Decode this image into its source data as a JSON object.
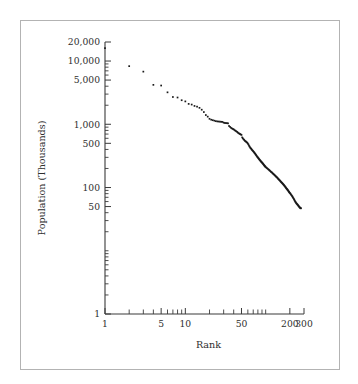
{
  "figure": {
    "border_color": "#b3b3b3",
    "background": "#ffffff"
  },
  "chart_data": {
    "type": "scatter",
    "title": "",
    "subtitle": "",
    "xlabel": "Rank",
    "ylabel": "Population (Thousands)",
    "xscale": "log",
    "yscale": "log",
    "xlim": [
      1,
      300
    ],
    "ylim": [
      1,
      20000
    ],
    "grid": false,
    "legend": null,
    "marker": "dot",
    "marker_color": "#1a1a1a",
    "x_tick_labels": [
      "1",
      "5",
      "10",
      "50",
      "200",
      "300"
    ],
    "x_tick_values": [
      1,
      5,
      10,
      50,
      200,
      300
    ],
    "x_minor_ticks": [
      2,
      3,
      4,
      6,
      7,
      8,
      9,
      20,
      30,
      40,
      60,
      70,
      80,
      90,
      100
    ],
    "y_tick_labels": [
      "1",
      "50",
      "100",
      "500",
      "1,000",
      "5,000",
      "10,000",
      "20,000"
    ],
    "y_tick_values": [
      1,
      50,
      100,
      500,
      1000,
      5000,
      10000,
      20000
    ],
    "y_minor_ticks": [
      2,
      3,
      4,
      5,
      6,
      7,
      8,
      9,
      10,
      20,
      30,
      40,
      60,
      70,
      80,
      90,
      200,
      300,
      400,
      600,
      700,
      800,
      900,
      2000,
      3000,
      4000,
      6000,
      7000,
      8000,
      9000
    ],
    "series": [
      {
        "name": "Population by rank",
        "x": [
          1,
          2,
          3,
          4,
          5,
          6,
          7,
          8,
          9,
          10,
          11,
          12,
          13,
          14,
          15,
          16,
          17,
          18,
          19,
          20,
          21,
          22,
          23,
          24,
          25,
          26,
          27,
          28,
          29,
          30,
          31,
          32,
          33,
          34,
          35,
          36,
          37,
          38,
          39,
          40,
          41,
          42,
          43,
          44,
          45,
          46,
          47,
          48,
          49,
          50,
          51,
          52,
          53,
          54,
          55,
          56,
          57,
          58,
          59,
          60,
          61,
          62,
          63,
          64,
          65,
          66,
          67,
          68,
          69,
          70,
          71,
          72,
          73,
          74,
          75,
          76,
          77,
          78,
          79,
          80,
          81,
          82,
          83,
          84,
          85,
          86,
          87,
          88,
          89,
          90,
          91,
          92,
          93,
          94,
          95,
          96,
          97,
          98,
          99,
          100,
          102,
          104,
          106,
          108,
          110,
          112,
          114,
          116,
          118,
          120,
          122,
          124,
          126,
          128,
          130,
          132,
          134,
          136,
          138,
          140,
          142,
          144,
          146,
          148,
          150,
          152,
          154,
          156,
          158,
          160,
          162,
          164,
          166,
          168,
          170,
          172,
          174,
          176,
          178,
          180,
          182,
          184,
          186,
          188,
          190,
          192,
          194,
          196,
          198,
          200,
          203,
          206,
          209,
          212,
          215,
          218,
          221,
          224,
          227,
          230,
          233,
          236,
          239,
          242,
          245,
          248,
          251,
          254,
          257,
          260,
          263,
          266,
          269,
          272,
          275
        ],
        "y": [
          16000,
          8300,
          6800,
          4200,
          4100,
          3200,
          2700,
          2650,
          2400,
          2300,
          2100,
          2050,
          1950,
          1900,
          1820,
          1700,
          1560,
          1400,
          1320,
          1220,
          1180,
          1160,
          1140,
          1120,
          1110,
          1105,
          1100,
          1095,
          1090,
          1060,
          1050,
          1045,
          1040,
          1035,
          940,
          910,
          880,
          860,
          845,
          830,
          810,
          790,
          775,
          760,
          740,
          725,
          710,
          700,
          690,
          680,
          620,
          600,
          580,
          565,
          550,
          540,
          530,
          520,
          510,
          495,
          480,
          460,
          445,
          430,
          420,
          410,
          400,
          390,
          382,
          375,
          366,
          358,
          350,
          342,
          334,
          326,
          318,
          310,
          304,
          298,
          292,
          286,
          280,
          275,
          270,
          265,
          260,
          256,
          252,
          248,
          244,
          240,
          236,
          232,
          228,
          224,
          220,
          217,
          214,
          211,
          206,
          202,
          198,
          194,
          190,
          186,
          182,
          178,
          175,
          172,
          168,
          165,
          162,
          159,
          156,
          153,
          150,
          147,
          145,
          142,
          139,
          136,
          134,
          131,
          129,
          127,
          124,
          122,
          120,
          118,
          116,
          114,
          112,
          110,
          108,
          106,
          104,
          102,
          100,
          98,
          96,
          95,
          93,
          91,
          90,
          88,
          86,
          85,
          83,
          82,
          80,
          78,
          76,
          74,
          72,
          70,
          68,
          66,
          64,
          62,
          60,
          59,
          57,
          56,
          55,
          54,
          53,
          52,
          51,
          50,
          49,
          48,
          48,
          47,
          47
        ]
      }
    ]
  }
}
